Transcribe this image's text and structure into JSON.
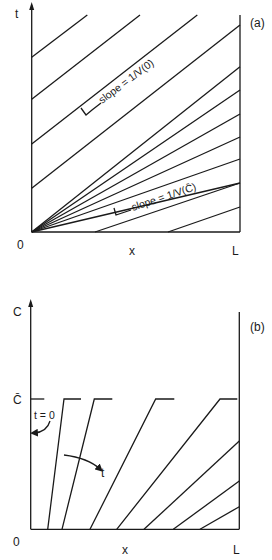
{
  "panel_a": {
    "tag": "(a)",
    "y_axis_label": "t",
    "x_axis_label": "x",
    "origin_label": "0",
    "x_end_label": "L",
    "annotation_top": "slope = 1/V(0)",
    "annotation_bottom": "slope = 1/V(C̄)",
    "parallel_lines_from_t_axis": [
      [
        31.7,
        57.3,
        87.3,
        15
      ],
      [
        31.7,
        99.3,
        140,
        15
      ],
      [
        31.7,
        144,
        197.3,
        15
      ],
      [
        31.7,
        188.3,
        240,
        25
      ]
    ],
    "fan_lines_from_origin_end_y": [
      66.7,
      90,
      114,
      137,
      159
    ],
    "lines_from_x_axis": [
      [
        95,
        232,
        240,
        183
      ],
      [
        168,
        232,
        240,
        207
      ]
    ]
  },
  "panel_b": {
    "tag": "(b)",
    "y_axis_label": "C",
    "c_bar_label": "C̄",
    "x_axis_label": "x",
    "origin_label": "0",
    "x_end_label": "L",
    "t0_label": "t = 0",
    "t_arrow_label": "t",
    "profiles": [
      {
        "bottom_x": 47.7,
        "top_x": 64,
        "plateau_end": 81
      },
      {
        "bottom_x": 62,
        "top_x": 94.3,
        "plateau_end": 112.3
      },
      {
        "bottom_x": 90,
        "top_x": 155.7,
        "plateau_end": 174.3
      },
      {
        "bottom_x": 116.7,
        "top_x": 220,
        "plateau_end": 237.3
      },
      {
        "bottom_x": 144,
        "right_edge_y": 441
      },
      {
        "bottom_x": 173.3,
        "right_edge_y": 481
      },
      {
        "bottom_x": 200,
        "right_edge_y": 506.7
      }
    ]
  }
}
